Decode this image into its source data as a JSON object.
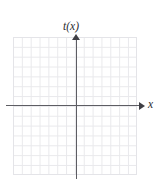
{
  "figure": {
    "title": "",
    "background_color": "#ffffff"
  },
  "axes": {
    "y_axis": {
      "label": "t(x)",
      "color": "#5d5d63",
      "arrow_direction": "up",
      "arrow_color": "#3f3f45"
    },
    "x_axis": {
      "label": "x",
      "color": "#5d5d63",
      "arrow_direction": "right",
      "arrow_color": "#3f3f45"
    }
  },
  "grid": {
    "line_color": "#e9e9ec",
    "border_color": "#e4e4e8",
    "columns": 14,
    "rows": 14,
    "visible": true
  },
  "chart_data": {
    "type": "line",
    "title": "",
    "xlabel": "x",
    "ylabel": "t(x)",
    "xlim": [
      -7,
      7
    ],
    "ylim": [
      -7,
      7
    ],
    "x_tick_labels": [],
    "y_tick_labels": [],
    "grid": true,
    "legend": "none",
    "series": [],
    "annotations": [],
    "note": "Empty coordinate grid with labeled axes; no data plotted."
  }
}
